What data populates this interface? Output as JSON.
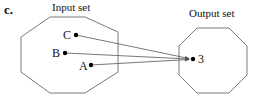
{
  "label": "c.",
  "input_set": {
    "title": "Input set",
    "elements": [
      {
        "name": "C",
        "x": 76,
        "y": 35
      },
      {
        "name": "B",
        "x": 65,
        "y": 53
      },
      {
        "name": "A",
        "x": 91,
        "y": 65
      }
    ]
  },
  "output_set": {
    "title": "Output set",
    "elements": [
      {
        "name": "3",
        "x": 193,
        "y": 59
      }
    ]
  },
  "mapping": [
    {
      "from": "C",
      "to": "3"
    },
    {
      "from": "B",
      "to": "3"
    },
    {
      "from": "A",
      "to": "3"
    }
  ],
  "colors": {
    "outline": "#7a7a7a",
    "arrow": "#555555",
    "dot": "#000000"
  }
}
